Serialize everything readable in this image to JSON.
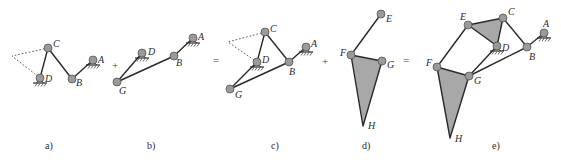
{
  "figure": {
    "panels": [
      {
        "id": "a",
        "caption": "a)"
      },
      {
        "id": "b",
        "caption": "b)"
      },
      {
        "id": "c",
        "caption": "c)"
      },
      {
        "id": "d",
        "caption": "d)"
      },
      {
        "id": "e",
        "caption": "e)"
      }
    ],
    "operators": [
      "+",
      "=",
      "+",
      "="
    ],
    "labels": {
      "A": "A",
      "B": "B",
      "C": "C",
      "D": "D",
      "E": "E",
      "F": "F",
      "G": "G",
      "H": "H"
    },
    "colors": {
      "link": "#2a2a2a",
      "joint": "#9a9a9a",
      "plate": "#a8a8a8",
      "background": "#ffffff"
    }
  }
}
